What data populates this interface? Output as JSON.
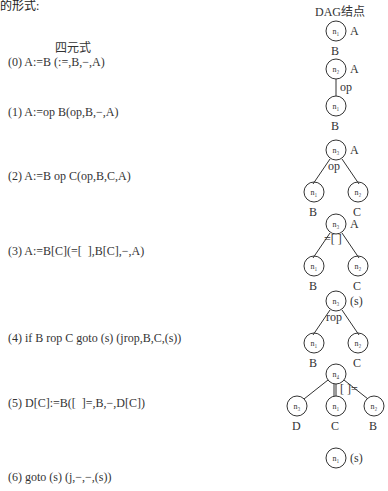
{
  "top_fragment": "的形式:",
  "headers": {
    "quadruple": "四元式",
    "dag": "DAG结点"
  },
  "quadruples": [
    {
      "index": "(0)",
      "text": "(0) A:=B (:=,B,−,A)"
    },
    {
      "index": "(1)",
      "text": "(1) A:=op B(op,B,−,A)"
    },
    {
      "index": "(2)",
      "text": "(2) A:=B op C(op,B,C,A)"
    },
    {
      "index": "(3)",
      "text": "(3) A:=B[C](=[  ],B[C],−,A)"
    },
    {
      "index": "(4)",
      "text": "(4) if B rop C goto (s) (jrop,B,C,(s))"
    },
    {
      "index": "(5)",
      "text": "(5) D[C]:=B([  ]=,B,−,D[C])"
    },
    {
      "index": "(6)",
      "text": "(6) goto (s) (j,−,−,(s))"
    }
  ],
  "dags": [
    {
      "nodes": [
        {
          "id": "n1",
          "label": "A",
          "leaf": "B"
        }
      ]
    },
    {
      "nodes": [
        {
          "id": "n2",
          "label": "A",
          "op": "op"
        },
        {
          "id": "n1",
          "leaf": "B"
        }
      ]
    },
    {
      "nodes": [
        {
          "id": "n3",
          "label": "A",
          "op": "op"
        },
        {
          "id": "n1",
          "leaf": "B"
        },
        {
          "id": "n2",
          "leaf": "C"
        }
      ]
    },
    {
      "nodes": [
        {
          "id": "n3",
          "label": "A",
          "op": "=[ ]"
        },
        {
          "id": "n1",
          "leaf": "B"
        },
        {
          "id": "n2",
          "leaf": "C"
        }
      ]
    },
    {
      "nodes": [
        {
          "id": "n3",
          "label": "(s)",
          "op": "rop"
        },
        {
          "id": "n1",
          "leaf": "B"
        },
        {
          "id": "n2",
          "leaf": "C"
        }
      ]
    },
    {
      "nodes": [
        {
          "id": "n4",
          "op": "[ ]="
        },
        {
          "id": "n3",
          "leaf": "D"
        },
        {
          "id": "n1",
          "leaf": "C"
        },
        {
          "id": "n2",
          "leaf": "B"
        }
      ]
    },
    {
      "nodes": [
        {
          "id": "n1",
          "label": "(s)"
        }
      ]
    }
  ]
}
